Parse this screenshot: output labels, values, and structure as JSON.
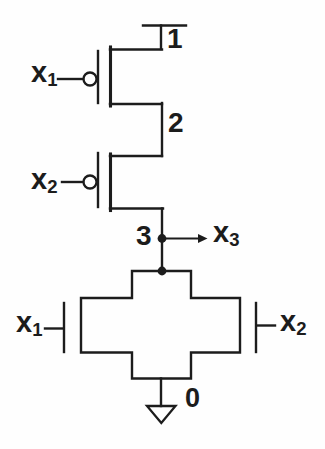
{
  "colors": {
    "ink": "#1c1c1c",
    "paper": "#fefefe"
  },
  "nodes": {
    "vdd": "1",
    "mid": "2",
    "out": "3",
    "gnd": "0"
  },
  "signals": {
    "pmos1_gate": {
      "base": "x",
      "sub": "1"
    },
    "pmos2_gate": {
      "base": "x",
      "sub": "2"
    },
    "output": {
      "base": "x",
      "sub": "3"
    },
    "nmos1_gate": {
      "base": "x",
      "sub": "1"
    },
    "nmos2_gate": {
      "base": "x",
      "sub": "2"
    }
  }
}
